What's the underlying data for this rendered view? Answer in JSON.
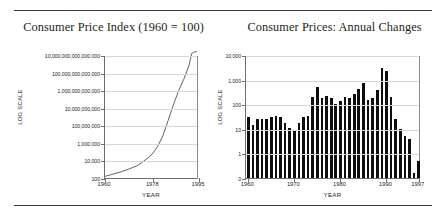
{
  "figure": {
    "panels": [
      {
        "id": "cpi-index",
        "title": "Consumer Price Index (1960 = 100)",
        "y_axis_title": "LOG SCALE",
        "x_axis_title": "YEAR"
      },
      {
        "id": "cpi-annual-changes",
        "title": "Consumer Prices: Annual Changes",
        "y_axis_title": "LOG SCALE",
        "x_axis_title": "YEAR"
      }
    ]
  },
  "chart_data": [
    {
      "type": "line",
      "id": "cpi-index",
      "title": "Consumer Price Index (1960 = 100)",
      "xlabel": "YEAR",
      "ylabel": "LOG SCALE",
      "yscale": "log",
      "ylim": [
        100,
        10000000000000000
      ],
      "ytick_labels": [
        "10,000,000,000,000,000",
        "100,000,000,000,000",
        "1,000,000,000,000",
        "10,000,000,000",
        "100,000,000",
        "1,000,000",
        "10,000",
        "100"
      ],
      "ytick_values": [
        1e+16,
        100000000000000.0,
        1000000000000.0,
        10000000000.0,
        100000000.0,
        1000000.0,
        10000.0,
        100.0
      ],
      "xlim": [
        1960,
        1995
      ],
      "xtick_labels": [
        "1960",
        "1978",
        "1995"
      ],
      "xtick_values": [
        1960,
        1978,
        1995
      ],
      "grid": true,
      "x": [
        1960,
        1963,
        1966,
        1969,
        1972,
        1974,
        1976,
        1978,
        1980,
        1982,
        1984,
        1986,
        1988,
        1990,
        1992,
        1993,
        1994,
        1995
      ],
      "values": [
        100,
        180,
        330,
        700,
        1600,
        4000,
        12000,
        40000,
        300000,
        5000000,
        300000000,
        20000000000,
        900000000000,
        20000000000000,
        900000000000000,
        20000000000000000,
        30000000000000000,
        32000000000000000
      ]
    },
    {
      "type": "bar",
      "id": "cpi-annual-changes",
      "title": "Consumer Prices: Annual Changes",
      "xlabel": "YEAR",
      "ylabel": "LOG SCALE",
      "yscale": "log",
      "ylim": [
        0,
        10000
      ],
      "ytick_labels": [
        "10,000",
        "1,000",
        "100",
        "10",
        "1",
        "0"
      ],
      "ytick_values": [
        10000,
        1000,
        100,
        10,
        1,
        0
      ],
      "xtick_labels": [
        "1960",
        "1970",
        "1980",
        "1990",
        "1997"
      ],
      "xtick_values": [
        1960,
        1970,
        1980,
        1990,
        1997
      ],
      "grid": true,
      "categories": [
        1960,
        1961,
        1962,
        1963,
        1964,
        1965,
        1966,
        1967,
        1968,
        1969,
        1970,
        1971,
        1972,
        1973,
        1974,
        1975,
        1976,
        1977,
        1978,
        1979,
        1980,
        1981,
        1982,
        1983,
        1984,
        1985,
        1986,
        1987,
        1988,
        1989,
        1990,
        1991,
        1992,
        1993,
        1994,
        1995,
        1996,
        1997
      ],
      "values": [
        30,
        14,
        26,
        25,
        25,
        31,
        32,
        30,
        18,
        11,
        9,
        18,
        30,
        34,
        200,
        500,
        180,
        210,
        180,
        100,
        140,
        200,
        180,
        260,
        400,
        700,
        150,
        180,
        380,
        3000,
        2300,
        200,
        25,
        10,
        5,
        4,
        0.2,
        0.7
      ]
    }
  ]
}
